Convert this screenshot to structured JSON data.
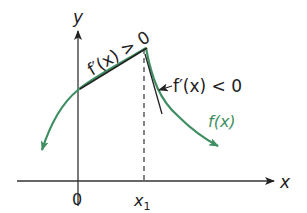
{
  "diagram": {
    "title": "",
    "colors": {
      "axis": "#222222",
      "curve": "#3f8f62",
      "tangent": "#222222",
      "background": "#ffffff"
    },
    "axes": {
      "x_label": "x",
      "y_label": "y",
      "origin_label": "0",
      "x1_label_base": "x",
      "x1_label_sub": "1"
    },
    "annotations": {
      "positive_slope": "f′(x) > 0",
      "negative_slope": "f′(x) < 0",
      "curve_label": "f(x)"
    }
  }
}
